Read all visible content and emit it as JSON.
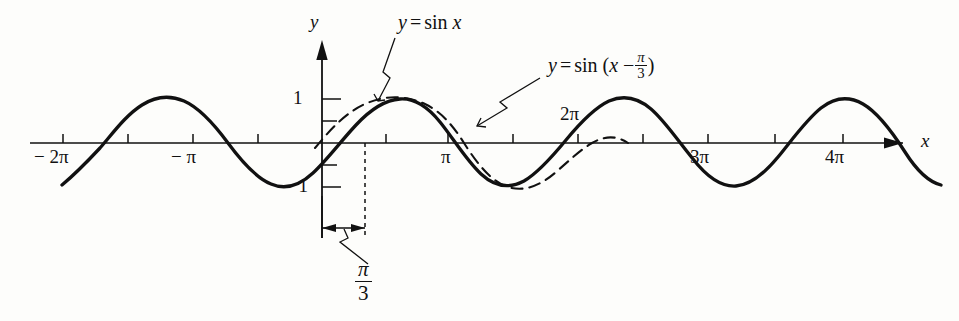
{
  "figure": {
    "kind": "graph",
    "background_color": "#fdfdfb",
    "ink_color": "#111111",
    "axes": {
      "x_axis_label": "x",
      "y_axis_label": "y",
      "origin_px": {
        "x": 322,
        "y": 143
      },
      "pi_px": 128,
      "unit_px": 44,
      "x_tick_labels": [
        {
          "text": "− 2π",
          "x_value": -6.2832,
          "position": "below"
        },
        {
          "text": "− π",
          "x_value": -3.1416,
          "position": "below"
        },
        {
          "text": "π",
          "x_value": 3.1416,
          "position": "below"
        },
        {
          "text": "2π",
          "x_value": 6.2832,
          "position": "above"
        },
        {
          "text": "3π",
          "x_value": 9.4248,
          "position": "below"
        },
        {
          "text": "4π",
          "x_value": 12.5664,
          "position": "below"
        }
      ],
      "x_ticks_at_half_pi": [
        -6.2832,
        -4.7124,
        -3.1416,
        -1.5708,
        1.5708,
        3.1416,
        4.7124,
        6.2832,
        7.854,
        9.4248,
        10.9956,
        12.5664
      ],
      "y_tick_labels": [
        {
          "text": "1",
          "y_value": 1
        },
        {
          "text": "− 1",
          "y_value": -1
        }
      ],
      "y_ticks_at": [
        1,
        0.5,
        -0.5,
        -1
      ]
    },
    "curves": [
      {
        "name": "sin-x",
        "label": "y = sin x",
        "style": "dashed",
        "equation": "y = sin(x)",
        "phase": 0,
        "amplitude": 1,
        "x_domain": [
          -0.18,
          8.0
        ]
      },
      {
        "name": "sin-x-minus-pi-over-3",
        "label": "y = sin (x − π/3)",
        "style": "solid",
        "equation": "y = sin(x - pi/3)",
        "phase": 1.0472,
        "amplitude": 1,
        "x_domain": [
          -6.45,
          12.95
        ]
      }
    ],
    "annotations": {
      "label_sin_x": {
        "y": "y",
        "equals": "=",
        "sin": "sin",
        "x": "x"
      },
      "label_sin_shift": {
        "y": "y",
        "equals": "=",
        "sin": "sin",
        "open_paren": "(",
        "x": "x",
        "minus": "−",
        "numerator": "π",
        "denominator": "3",
        "close_paren": ")"
      },
      "phase_shift": {
        "numerator": "π",
        "denominator": "3",
        "measure_from_x": 0,
        "measure_to_x": 1.0472,
        "description": "phase shift measured between x = 0 and x = pi/3"
      }
    }
  }
}
